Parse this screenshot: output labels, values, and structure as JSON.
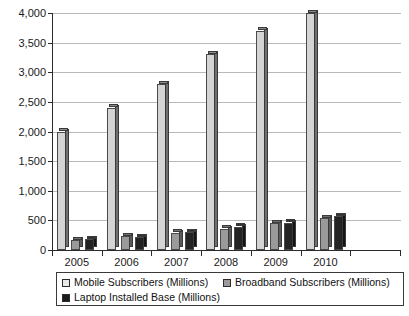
{
  "chart_data": {
    "type": "bar",
    "title": "",
    "subtitle": "",
    "xlabel": "",
    "ylabel": "",
    "categories": [
      "2005",
      "2006",
      "2007",
      "2008",
      "2009",
      "2010"
    ],
    "series": [
      {
        "name": "Mobile Subscribers (Millions)",
        "color": "#d4d4d4",
        "values": [
          2000,
          2400,
          2800,
          3300,
          3700,
          4000
        ]
      },
      {
        "name": "Broadband Subscribers (Millions)",
        "color": "#9a9a9a",
        "values": [
          165,
          230,
          290,
          360,
          450,
          540
        ]
      },
      {
        "name": "Laptop Installed Base (Millions)",
        "color": "#232323",
        "values": [
          180,
          215,
          300,
          390,
          460,
          570
        ]
      }
    ],
    "ylim": [
      0,
      4000
    ],
    "yticks": [
      0,
      500,
      1000,
      1500,
      2000,
      2500,
      3000,
      3500,
      4000
    ],
    "ytick_labels": [
      "0",
      "500",
      "1,000",
      "1,500",
      "2,000",
      "2,500",
      "3,000",
      "3,500",
      "4,000"
    ],
    "grid": true,
    "legend_position": "bottom"
  },
  "legend": {
    "entries": [
      {
        "label": "Mobile Subscribers (Millions)"
      },
      {
        "label": "Broadband Subscribers (Millions)"
      },
      {
        "label": "Laptop Installed Base (Millions)"
      }
    ]
  }
}
